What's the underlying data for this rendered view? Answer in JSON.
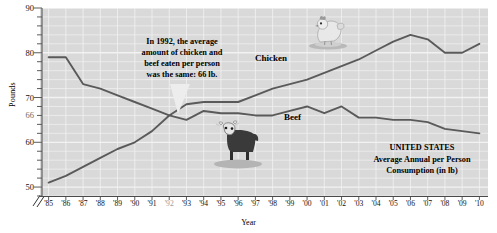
{
  "chart_data": {
    "type": "line",
    "xlabel": "Year",
    "ylabel": "Pounds",
    "ylim": [
      48,
      90
    ],
    "yticks": [
      50,
      60,
      66,
      70,
      80,
      90
    ],
    "ytick_labels": [
      "50",
      "60",
      "66",
      "70",
      "80",
      "90"
    ],
    "y_highlight_tick": "66",
    "y_axis_break": true,
    "grid": true,
    "legend_position": "inline-labels",
    "categories": [
      "'85",
      "'86",
      "'87",
      "'88",
      "'89",
      "'90",
      "'91",
      "'92",
      "'93",
      "'94",
      "'95",
      "'96",
      "'97",
      "'98",
      "'99",
      "'00",
      "'01",
      "'02",
      "'03",
      "'04",
      "'05",
      "'06",
      "'07",
      "'08",
      "'09",
      "'10"
    ],
    "x_highlight_tick": "'92",
    "series": [
      {
        "name": "Beef",
        "values": [
          79,
          79,
          73,
          72,
          70.5,
          69,
          67.5,
          66,
          65,
          67,
          66.5,
          66.5,
          66,
          66,
          67,
          68,
          66.5,
          68,
          65.5,
          65.5,
          65,
          65,
          64.5,
          63,
          62.5,
          62
        ]
      },
      {
        "name": "Chicken",
        "values": [
          51,
          52.5,
          54.5,
          56.5,
          58.5,
          60,
          62.5,
          66,
          68.5,
          69,
          69,
          69,
          70.5,
          72,
          73,
          74,
          75.5,
          77,
          78.5,
          80.5,
          82.5,
          84,
          83,
          80,
          80,
          82
        ]
      }
    ],
    "annotations": [
      {
        "name": "callout",
        "lines": [
          "In 1992, the average",
          "amount of chicken and",
          "beef eaten per person",
          "was the same: 66 lb."
        ]
      },
      {
        "name": "title-block",
        "lines": [
          "UNITED STATES",
          "Average Annual per Person",
          "Consumption (in lb)"
        ]
      }
    ]
  },
  "colors": {
    "plot_background": "#d9d9d9",
    "gridline": "#f2f2f2",
    "line": "#5a5a5a",
    "text": "#111111",
    "highlight_text": "#9a9a9a"
  },
  "icons": {
    "chicken": "chicken-illustration",
    "cow": "cow-illustration"
  }
}
